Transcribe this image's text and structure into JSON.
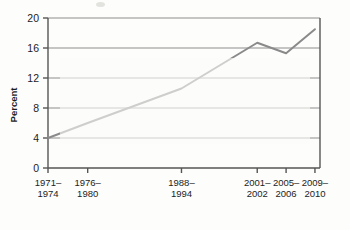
{
  "chart_data": {
    "type": "line",
    "title": "",
    "xlabel": "",
    "ylabel": "Percent",
    "categories": [
      "1971–1974",
      "1976–1980",
      "1988–1994",
      "2001–2002",
      "2005–2006",
      "2009–2010"
    ],
    "x_positions": [
      1972.5,
      1978.0,
      1991.0,
      2001.5,
      2005.5,
      2009.5
    ],
    "values": [
      4.0,
      6.0,
      10.6,
      16.7,
      15.3,
      18.5
    ],
    "ylim": [
      0,
      20
    ],
    "yticks": [
      0,
      4,
      8,
      12,
      16,
      20
    ],
    "ytick_labels": [
      "0",
      "4",
      "8",
      "12",
      "16",
      "20"
    ],
    "xlim": [
      1972.5,
      2010.2
    ],
    "grid": "horizontal",
    "legend": "none",
    "line_color": "#8a8a8a",
    "axis_color": "#555555",
    "grid_color": "#8d8d8d",
    "text_color": "#1c1c1c",
    "background_color": "#fdfdfc"
  },
  "axis": {
    "y_label": "Percent"
  }
}
